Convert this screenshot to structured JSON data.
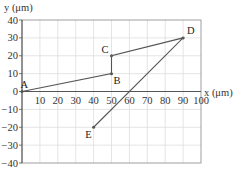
{
  "chart_data": {
    "type": "line",
    "title": "",
    "xlabel": "x (μm)",
    "ylabel": "y (μm)",
    "xlim": [
      0,
      100
    ],
    "ylim": [
      -40,
      40
    ],
    "grid": true,
    "x_ticks": [
      10,
      20,
      30,
      40,
      50,
      60,
      70,
      80,
      90,
      100
    ],
    "y_ticks": [
      40,
      30,
      20,
      10,
      0,
      -10,
      -20,
      -30,
      -40
    ],
    "points": [
      {
        "label": "A",
        "x": 0,
        "y": 0
      },
      {
        "label": "B",
        "x": 50,
        "y": 10
      },
      {
        "label": "C",
        "x": 50,
        "y": 20
      },
      {
        "label": "D",
        "x": 90,
        "y": 30
      },
      {
        "label": "E",
        "x": 40,
        "y": -20
      }
    ],
    "path_order": [
      "A",
      "B",
      "C",
      "D",
      "E"
    ],
    "legend": null
  },
  "colors": {
    "line": "#555555",
    "grid": "#dddddd",
    "axis": "#555555",
    "frame": "#888888"
  }
}
